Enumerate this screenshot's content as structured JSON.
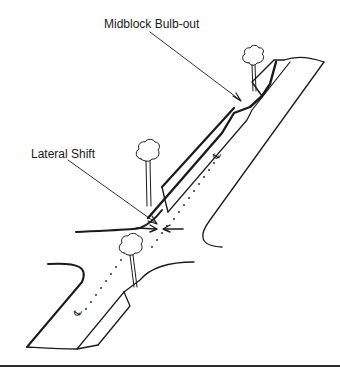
{
  "diagram": {
    "labels": {
      "midblock_bulb_out": "Midblock Bulb-out",
      "lateral_shift": "Lateral Shift"
    },
    "centerline_symbol": "℄",
    "colors": {
      "ink": "#1a1a1a",
      "background": "#ffffff"
    }
  }
}
